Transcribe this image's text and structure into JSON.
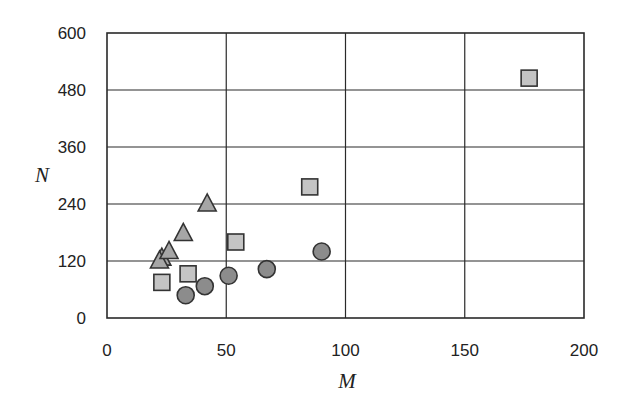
{
  "chart_data": {
    "type": "scatter",
    "title": "",
    "xlabel": "M",
    "ylabel": "N",
    "xlim": [
      0,
      200
    ],
    "ylim": [
      0,
      600
    ],
    "xticks": [
      0,
      50,
      100,
      150,
      200
    ],
    "yticks": [
      0,
      120,
      240,
      360,
      480,
      600
    ],
    "grid": true,
    "legend": null,
    "series": [
      {
        "name": "squares",
        "marker": "square",
        "fill": "#c4c4c4",
        "stroke": "#333333",
        "points": [
          {
            "x": 23,
            "y": 75
          },
          {
            "x": 34,
            "y": 93
          },
          {
            "x": 54,
            "y": 160
          },
          {
            "x": 85,
            "y": 276
          },
          {
            "x": 177,
            "y": 505
          }
        ]
      },
      {
        "name": "triangles",
        "marker": "triangle",
        "fill": "#a6a6a6",
        "stroke": "#333333",
        "points": [
          {
            "x": 23,
            "y": 126
          },
          {
            "x": 22,
            "y": 120
          },
          {
            "x": 26,
            "y": 140
          },
          {
            "x": 32,
            "y": 178
          },
          {
            "x": 42,
            "y": 240
          }
        ]
      },
      {
        "name": "circles",
        "marker": "circle",
        "fill": "#8c8c8c",
        "stroke": "#333333",
        "points": [
          {
            "x": 33,
            "y": 48
          },
          {
            "x": 41,
            "y": 67
          },
          {
            "x": 51,
            "y": 89
          },
          {
            "x": 67,
            "y": 103
          },
          {
            "x": 90,
            "y": 140
          }
        ]
      }
    ]
  }
}
